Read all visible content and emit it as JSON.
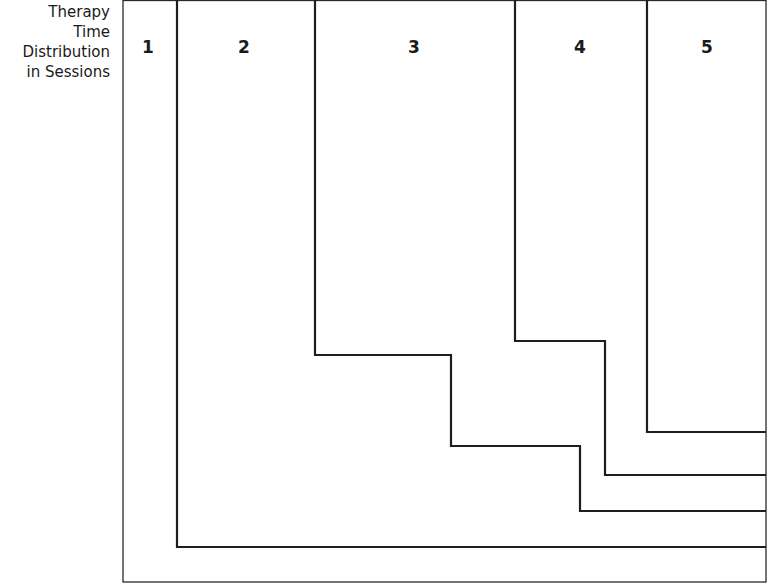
{
  "title_lines": [
    "Therapy",
    "Time",
    "Distribution",
    "in Sessions"
  ],
  "sections": [
    {
      "label": "1",
      "x": 148
    },
    {
      "label": "2",
      "x": 244
    },
    {
      "label": "3",
      "x": 414
    },
    {
      "label": "4",
      "x": 580
    },
    {
      "label": "5",
      "x": 707
    }
  ],
  "colors": {
    "line": "#1e1e1e",
    "background": "#ffffff"
  }
}
